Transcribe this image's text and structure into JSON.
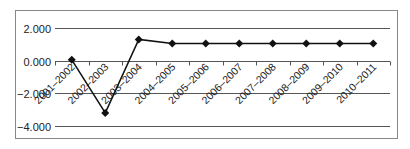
{
  "chart_data": {
    "type": "line",
    "title": "",
    "xlabel": "",
    "ylabel": "",
    "categories": [
      "2001–2002",
      "2002–2003",
      "2003–2004",
      "2004–2005",
      "2005–2006",
      "2006–2007",
      "2007–2008",
      "2008–2009",
      "2009–2010",
      "2010–2011"
    ],
    "series": [
      {
        "name": "Series 1",
        "values": [
          0.05,
          -3.2,
          1.3,
          1.05,
          1.05,
          1.05,
          1.05,
          1.05,
          1.05,
          1.05
        ],
        "color": "#111111",
        "marker": "diamond"
      }
    ],
    "ylim": [
      -4.0,
      2.0
    ],
    "yticks": [
      2.0,
      0.0,
      -2.0,
      -4.0
    ],
    "ytick_labels": [
      "2.000",
      "0.000",
      "−2.000",
      "−4.000"
    ],
    "grid": true,
    "legend": null
  },
  "colors": {
    "line": "#111111",
    "grid": "#555555",
    "border": "#888888"
  }
}
